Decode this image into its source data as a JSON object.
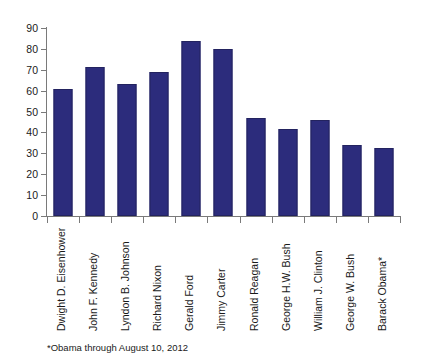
{
  "chart_data": {
    "type": "bar",
    "title": "",
    "subtitle": "",
    "xlabel": "",
    "ylabel": "",
    "ylim": [
      0,
      90
    ],
    "ytick_step": 10,
    "yticks": [
      "0",
      "10",
      "20",
      "30",
      "40",
      "50",
      "60",
      "70",
      "80",
      "90"
    ],
    "grid": false,
    "legend": false,
    "bar_color": "#2c2c7c",
    "categories": [
      "Dwight D. Eisenhower",
      "John F. Kennedy",
      "Lyndon B. Johnson",
      "Richard Nixon",
      "Gerald Ford",
      "Jimmy Carter",
      "Ronald Reagan",
      "George H.W. Bush",
      "William J. Clinton",
      "George W. Bush",
      "Barack Obama*"
    ],
    "values": [
      61,
      71.5,
      63,
      69,
      84,
      80,
      47,
      41.5,
      46,
      34,
      32.5
    ],
    "annotations": [
      "*Obama through August 10, 2012"
    ]
  },
  "footnote": "*Obama through August 10, 2012"
}
